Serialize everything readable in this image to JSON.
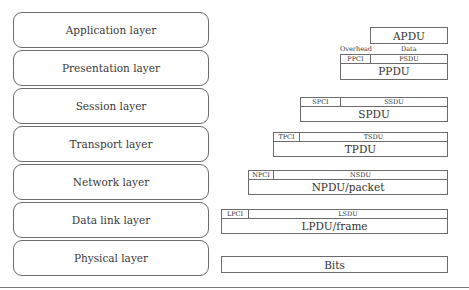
{
  "layers": [
    {
      "label": "Application layer"
    },
    {
      "label": "Presentation layer"
    },
    {
      "label": "Session layer"
    },
    {
      "label": "Transport layer"
    },
    {
      "label": "Network layer"
    },
    {
      "label": "Data link layer"
    },
    {
      "label": "Physical layer"
    }
  ],
  "pdus": {
    "application": {
      "name": "APDU"
    },
    "presentation": {
      "overhead_label": "Overhead",
      "data_label": "Data",
      "pci": "PPCI",
      "sdu": "PSDU",
      "name": "PPDU"
    },
    "session": {
      "pci": "SPCI",
      "sdu": "SSDU",
      "name": "SPDU"
    },
    "transport": {
      "pci": "TPCI",
      "sdu": "TSDU",
      "name": "TPDU"
    },
    "network": {
      "pci": "NPCI",
      "sdu": "NSDU",
      "name": "NPDU/packet"
    },
    "datalink": {
      "pci": "LPCI",
      "sdu": "LSDU",
      "name": "LPDU/frame"
    },
    "physical": {
      "name": "Bits"
    }
  }
}
